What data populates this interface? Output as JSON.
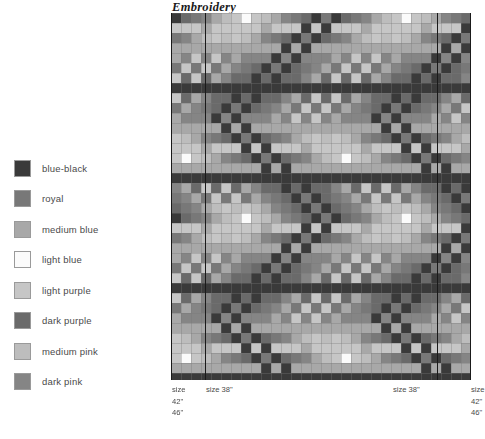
{
  "chart": {
    "title": "Embroidery",
    "type": "pattern-chart"
  },
  "legend": {
    "items": [
      {
        "label": "blue-black",
        "color": "#3a3a3a"
      },
      {
        "label": "royal",
        "color": "#787878"
      },
      {
        "label": "medium blue",
        "color": "#a8a8a8"
      },
      {
        "label": "light blue",
        "color": "#fbfbfb"
      },
      {
        "label": "light purple",
        "color": "#c6c6c6"
      },
      {
        "label": "dark purple",
        "color": "#6a6a6a"
      },
      {
        "label": "medium pink",
        "color": "#bdbdbd"
      },
      {
        "label": "dark pink",
        "color": "#858585"
      }
    ]
  },
  "size_markers": [
    {
      "name": "left-outer",
      "lines": [
        "size",
        "42\"",
        "46\""
      ],
      "x": 171,
      "align": "left"
    },
    {
      "name": "left-inner",
      "lines": [
        "size 38\""
      ],
      "x": 205,
      "align": "left"
    },
    {
      "name": "right-inner",
      "lines": [
        "size 38\""
      ],
      "x": 437,
      "align": "right"
    },
    {
      "name": "right-outer",
      "lines": [
        "size",
        "42\"",
        "46\""
      ],
      "x": 470,
      "align": "left"
    }
  ],
  "chart_data": {
    "type": "heatmap",
    "title": "Embroidery",
    "xlabel": "",
    "ylabel": "",
    "grid": true,
    "legend_position": "left",
    "cell_size": 10,
    "columns": 30,
    "rows": 37,
    "palette": [
      "#3a3a3a",
      "#787878",
      "#a8a8a8",
      "#fbfbfb",
      "#c6c6c6",
      "#6a6a6a",
      "#bdbdbd",
      "#858585"
    ],
    "palette_names": [
      "blue-black",
      "royal",
      "medium blue",
      "light blue",
      "light purple",
      "dark purple",
      "medium pink",
      "dark pink"
    ],
    "pattern": "chevron-plaid",
    "chevron_period_x": 16,
    "chevron_period_y": 20,
    "marker_columns": [
      0,
      3,
      27,
      30
    ],
    "marker_labels": [
      "size 42\" 46\"",
      "size 38\"",
      "size 38\"",
      "size 42\" 46\""
    ]
  }
}
